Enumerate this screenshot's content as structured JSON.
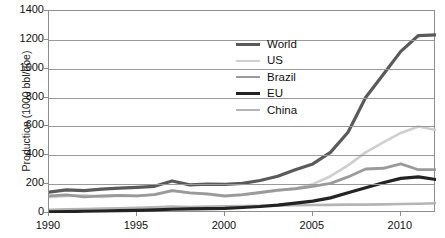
{
  "chart_data": {
    "type": "line",
    "title": "",
    "xlabel": "",
    "ylabel": "Production (1000 bbl/doe)",
    "xlim": [
      1990,
      2012
    ],
    "ylim": [
      0,
      1400
    ],
    "grid": true,
    "legend_position": "upper-center-inside",
    "x": [
      1990,
      1991,
      1992,
      1993,
      1994,
      1995,
      1996,
      1997,
      1998,
      1999,
      2000,
      2001,
      2002,
      2003,
      2004,
      2005,
      2006,
      2007,
      2008,
      2009,
      2010,
      2011,
      2012
    ],
    "xticks": [
      "1990",
      "1995",
      "2000",
      "2005",
      "2010"
    ],
    "yticks": [
      "0",
      "200",
      "400",
      "600",
      "800",
      "1000",
      "1200",
      "1400"
    ],
    "series": [
      {
        "name": "World",
        "color": "#5a5a5a",
        "width": 3.2,
        "values": [
          145,
          160,
          155,
          165,
          172,
          178,
          185,
          222,
          195,
          200,
          198,
          205,
          225,
          255,
          300,
          340,
          420,
          560,
          800,
          960,
          1120,
          1230,
          1235
        ]
      },
      {
        "name": "US",
        "color": "#cfcfcf",
        "width": 2.6,
        "values": [
          110,
          118,
          122,
          112,
          120,
          118,
          128,
          155,
          140,
          130,
          115,
          125,
          140,
          155,
          170,
          200,
          255,
          330,
          420,
          490,
          555,
          600,
          575
        ]
      },
      {
        "name": "Brazil",
        "color": "#9a9a9a",
        "width": 2.8,
        "values": [
          118,
          125,
          112,
          118,
          122,
          118,
          128,
          155,
          140,
          132,
          118,
          128,
          142,
          158,
          168,
          185,
          205,
          250,
          305,
          310,
          340,
          300,
          300
        ]
      },
      {
        "name": "EU",
        "color": "#232323",
        "width": 3.2,
        "values": [
          8,
          10,
          12,
          14,
          16,
          18,
          22,
          26,
          28,
          30,
          32,
          38,
          45,
          55,
          68,
          82,
          105,
          140,
          175,
          210,
          240,
          250,
          232
        ]
      },
      {
        "name": "China",
        "color": "#b5b5b5",
        "width": 2.6,
        "values": [
          22,
          26,
          28,
          30,
          33,
          36,
          40,
          44,
          42,
          44,
          46,
          48,
          50,
          52,
          54,
          55,
          56,
          58,
          58,
          60,
          62,
          64,
          68
        ]
      }
    ]
  },
  "axis": {
    "y_title": "Production (1000 bbl/doe)",
    "y_ticks": [
      "1400",
      "1200",
      "1000",
      "800",
      "600",
      "400",
      "200",
      "0"
    ],
    "x_ticks": [
      "1990",
      "1995",
      "2000",
      "2005",
      "2010"
    ]
  },
  "legend": {
    "items": [
      {
        "label": "World"
      },
      {
        "label": "US"
      },
      {
        "label": "Brazil"
      },
      {
        "label": "EU"
      },
      {
        "label": "China"
      }
    ]
  }
}
